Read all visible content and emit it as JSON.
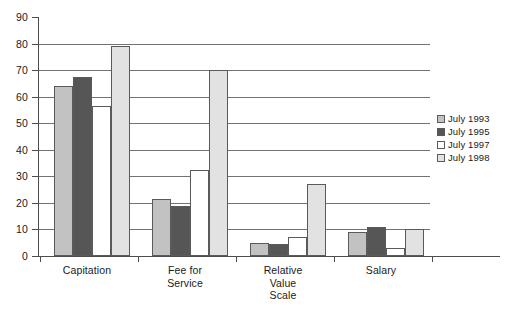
{
  "chart_data": {
    "type": "bar",
    "title": "",
    "subtitle": "",
    "xlabel": "",
    "ylabel": "",
    "ylim": [
      0,
      90
    ],
    "ytick_step": 10,
    "ytick_labels": [
      "90",
      "80",
      "70",
      "60",
      "50",
      "40",
      "30",
      "20",
      "10",
      "0"
    ],
    "ytick_values": [
      90,
      80,
      70,
      60,
      50,
      40,
      30,
      20,
      10,
      0
    ],
    "grid": true,
    "grid_axis": "y",
    "legend_position": "right",
    "categories": [
      "Capitation",
      "Fee for Service",
      "Relative Value Scale",
      "Salary"
    ],
    "category_label_lines": [
      [
        "Capitation"
      ],
      [
        "Fee for",
        "Service"
      ],
      [
        "Relative",
        "Value",
        "Scale"
      ],
      [
        "Salary"
      ]
    ],
    "series": [
      {
        "name": "July 1993",
        "color": "#c2c2c2",
        "values": [
          64,
          21.5,
          5,
          9
        ]
      },
      {
        "name": "July 1995",
        "color": "#565656",
        "values": [
          67.5,
          19,
          4.5,
          11
        ]
      },
      {
        "name": "July 1997",
        "color": "#ffffff",
        "values": [
          56.5,
          32.5,
          7,
          3
        ]
      },
      {
        "name": "July 1998",
        "color": "#e2e2e2",
        "values": [
          79,
          70,
          27,
          10
        ]
      }
    ]
  },
  "legend": {
    "items": [
      {
        "label": "July 1993",
        "color": "#c2c2c2"
      },
      {
        "label": "July 1995",
        "color": "#565656"
      },
      {
        "label": "July 1997",
        "color": "#ffffff"
      },
      {
        "label": "July 1998",
        "color": "#e2e2e2"
      }
    ]
  }
}
